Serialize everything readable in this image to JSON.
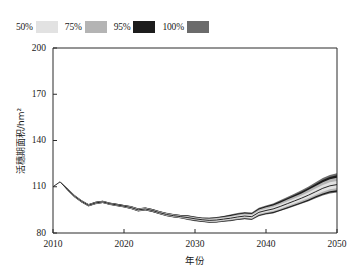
{
  "legend": {
    "position": "top-left",
    "items": [
      {
        "label": "50%",
        "color": "#e2e2e2",
        "name": "legend-swatch-50"
      },
      {
        "label": "75%",
        "color": "#b4b4b4",
        "name": "legend-swatch-75"
      },
      {
        "label": "95%",
        "color": "#1c1c1c",
        "name": "legend-swatch-95"
      },
      {
        "label": "100%",
        "color": "#6b6b6b",
        "name": "legend-swatch-100"
      }
    ]
  },
  "axes": {
    "y": {
      "title": "活穗期面积/hm²",
      "ticks": [
        "200",
        "170",
        "140",
        "110",
        "80"
      ],
      "min": 80,
      "max": 200
    },
    "x": {
      "title": "年份",
      "ticks": [
        "2010",
        "2020",
        "2030",
        "2040",
        "2050"
      ],
      "min": 2010,
      "max": 2050
    }
  },
  "chart_data": {
    "type": "area",
    "title": "",
    "xlabel": "年份",
    "ylabel": "活穗期面积/hm²",
    "xlim": [
      2010,
      2050
    ],
    "ylim": [
      80,
      200
    ],
    "grid": false,
    "legend_position": "top-left",
    "x": [
      2010,
      2011,
      2012,
      2013,
      2014,
      2015,
      2016,
      2017,
      2018,
      2019,
      2020,
      2021,
      2022,
      2023,
      2024,
      2025,
      2026,
      2027,
      2028,
      2029,
      2030,
      2031,
      2032,
      2033,
      2034,
      2035,
      2036,
      2037,
      2038,
      2039,
      2040,
      2041,
      2042,
      2043,
      2044,
      2045,
      2046,
      2047,
      2048,
      2049,
      2050
    ],
    "series": [
      {
        "name": "median",
        "values": [
          110.0,
          113.2,
          108.5,
          104.0,
          100.6,
          98.0,
          99.5,
          100.2,
          99.0,
          98.2,
          97.4,
          96.5,
          95.0,
          95.6,
          94.6,
          93.2,
          92.0,
          91.2,
          90.6,
          90.0,
          89.2,
          88.6,
          88.2,
          88.4,
          89.0,
          89.6,
          90.4,
          91.0,
          90.6,
          93.4,
          94.6,
          95.6,
          97.2,
          99.0,
          100.8,
          102.6,
          104.6,
          106.8,
          109.0,
          110.6,
          111.4
        ]
      },
      {
        "name": "50% band lower",
        "values": [
          110.0,
          113.2,
          108.3,
          103.7,
          100.3,
          97.7,
          99.2,
          99.9,
          98.7,
          97.9,
          97.1,
          96.1,
          94.6,
          95.2,
          94.2,
          92.8,
          91.5,
          90.7,
          90.1,
          89.4,
          88.6,
          88.0,
          87.5,
          87.6,
          88.2,
          88.7,
          89.5,
          90.0,
          89.6,
          92.3,
          93.4,
          94.3,
          95.8,
          97.5,
          99.2,
          100.9,
          102.7,
          104.8,
          106.8,
          108.3,
          109.0
        ]
      },
      {
        "name": "50% band upper",
        "values": [
          110.0,
          113.2,
          108.7,
          104.3,
          100.9,
          98.3,
          99.8,
          100.5,
          99.3,
          98.5,
          97.7,
          96.9,
          95.4,
          96.0,
          95.0,
          93.6,
          92.5,
          91.7,
          91.1,
          90.6,
          89.8,
          89.2,
          88.9,
          89.2,
          89.8,
          90.5,
          91.3,
          92.0,
          91.6,
          94.5,
          95.8,
          96.9,
          98.6,
          100.5,
          102.4,
          104.3,
          106.5,
          108.8,
          111.2,
          112.9,
          113.8
        ]
      },
      {
        "name": "75% band lower",
        "values": [
          110.0,
          113.2,
          108.1,
          103.5,
          100.1,
          97.5,
          99.0,
          99.7,
          98.5,
          97.7,
          96.9,
          95.8,
          94.3,
          94.9,
          93.9,
          92.5,
          91.2,
          90.4,
          89.8,
          89.0,
          88.2,
          87.6,
          87.1,
          87.2,
          87.8,
          88.2,
          89.0,
          89.5,
          89.1,
          91.7,
          92.8,
          93.6,
          95.1,
          96.7,
          98.4,
          100.0,
          101.8,
          103.8,
          105.7,
          107.1,
          107.7
        ]
      },
      {
        "name": "75% band upper",
        "values": [
          110.0,
          113.2,
          108.9,
          104.5,
          101.1,
          98.5,
          100.0,
          100.7,
          99.5,
          98.7,
          97.9,
          97.2,
          95.7,
          96.3,
          95.3,
          93.9,
          92.8,
          92.0,
          91.4,
          91.0,
          90.2,
          89.6,
          89.4,
          89.7,
          90.4,
          91.1,
          92.0,
          92.7,
          92.3,
          95.3,
          96.7,
          97.9,
          99.7,
          101.7,
          103.7,
          105.7,
          108.0,
          110.5,
          113.0,
          114.8,
          115.8
        ]
      },
      {
        "name": "95% band lower",
        "values": [
          110.0,
          113.2,
          107.9,
          103.3,
          99.9,
          97.3,
          98.8,
          99.5,
          98.3,
          97.5,
          96.7,
          95.6,
          94.1,
          94.7,
          93.7,
          92.3,
          91.0,
          90.2,
          89.6,
          88.7,
          87.9,
          87.3,
          86.8,
          86.9,
          87.5,
          87.9,
          88.6,
          89.1,
          88.7,
          91.2,
          92.3,
          93.0,
          94.5,
          96.1,
          97.7,
          99.3,
          101.0,
          103.0,
          104.8,
          106.2,
          106.8
        ]
      },
      {
        "name": "95% band upper",
        "values": [
          110.0,
          113.2,
          109.1,
          104.7,
          101.3,
          98.7,
          100.2,
          100.9,
          99.7,
          98.9,
          98.1,
          97.4,
          95.9,
          96.5,
          95.5,
          94.1,
          93.0,
          92.2,
          91.6,
          91.3,
          90.5,
          89.9,
          89.8,
          90.1,
          90.8,
          91.6,
          92.5,
          93.2,
          92.8,
          95.9,
          97.4,
          98.7,
          100.6,
          102.6,
          104.7,
          106.8,
          109.2,
          111.8,
          114.4,
          116.3,
          117.4
        ]
      },
      {
        "name": "100% band lower",
        "values": [
          110.0,
          113.2,
          107.8,
          103.2,
          99.8,
          97.2,
          98.7,
          99.4,
          98.2,
          97.4,
          96.6,
          95.5,
          94.0,
          94.6,
          93.6,
          92.2,
          90.9,
          90.1,
          89.5,
          88.5,
          87.7,
          87.1,
          86.6,
          86.7,
          87.3,
          87.7,
          88.4,
          88.9,
          88.5,
          90.9,
          92.0,
          92.7,
          94.2,
          95.8,
          97.3,
          98.9,
          100.6,
          102.5,
          104.3,
          105.7,
          106.3
        ]
      },
      {
        "name": "100% band upper",
        "values": [
          110.0,
          113.2,
          109.2,
          104.8,
          101.4,
          98.8,
          100.3,
          101.0,
          99.8,
          99.0,
          98.2,
          97.5,
          96.0,
          96.6,
          95.6,
          94.2,
          93.1,
          92.3,
          91.7,
          91.5,
          90.7,
          90.1,
          90.1,
          90.4,
          91.1,
          92.0,
          93.0,
          93.7,
          93.3,
          96.3,
          97.8,
          99.2,
          101.2,
          103.3,
          105.5,
          107.7,
          110.2,
          112.9,
          115.6,
          117.6,
          118.8
        ]
      }
    ]
  }
}
